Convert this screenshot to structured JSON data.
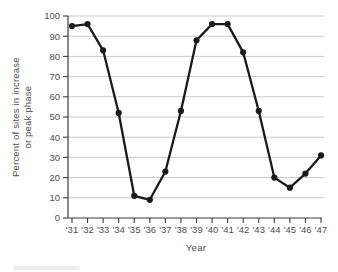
{
  "chart_data": {
    "type": "line",
    "x": [
      "'31",
      "'32",
      "'33",
      "'34",
      "'35",
      "'36",
      "'37",
      "'38",
      "'39",
      "'40",
      "'41",
      "'42",
      "'43",
      "'44",
      "'45",
      "'46",
      "'47"
    ],
    "values": [
      95,
      96,
      83,
      52,
      11,
      9,
      23,
      53,
      88,
      96,
      96,
      82,
      53,
      20,
      15,
      22,
      31
    ],
    "title": "",
    "xlabel": "Year",
    "ylabel": "Percent of sites in increase or peak phase",
    "ylabel_line1": "Percent of sites in increase",
    "ylabel_line2": "or peak phase",
    "ylim": [
      0,
      100
    ],
    "yticks": [
      0,
      10,
      20,
      30,
      40,
      50,
      60,
      70,
      80,
      90,
      100
    ],
    "grid": "horizontal-only",
    "legend": "none",
    "marker": "filled-circle",
    "colors": {
      "line": "#1a1a1a",
      "marker": "#1a1a1a",
      "grid": "#c9c9c9",
      "axis": "#3c3c3c",
      "text": "#4d4d4d",
      "background": "#ffffff"
    }
  }
}
